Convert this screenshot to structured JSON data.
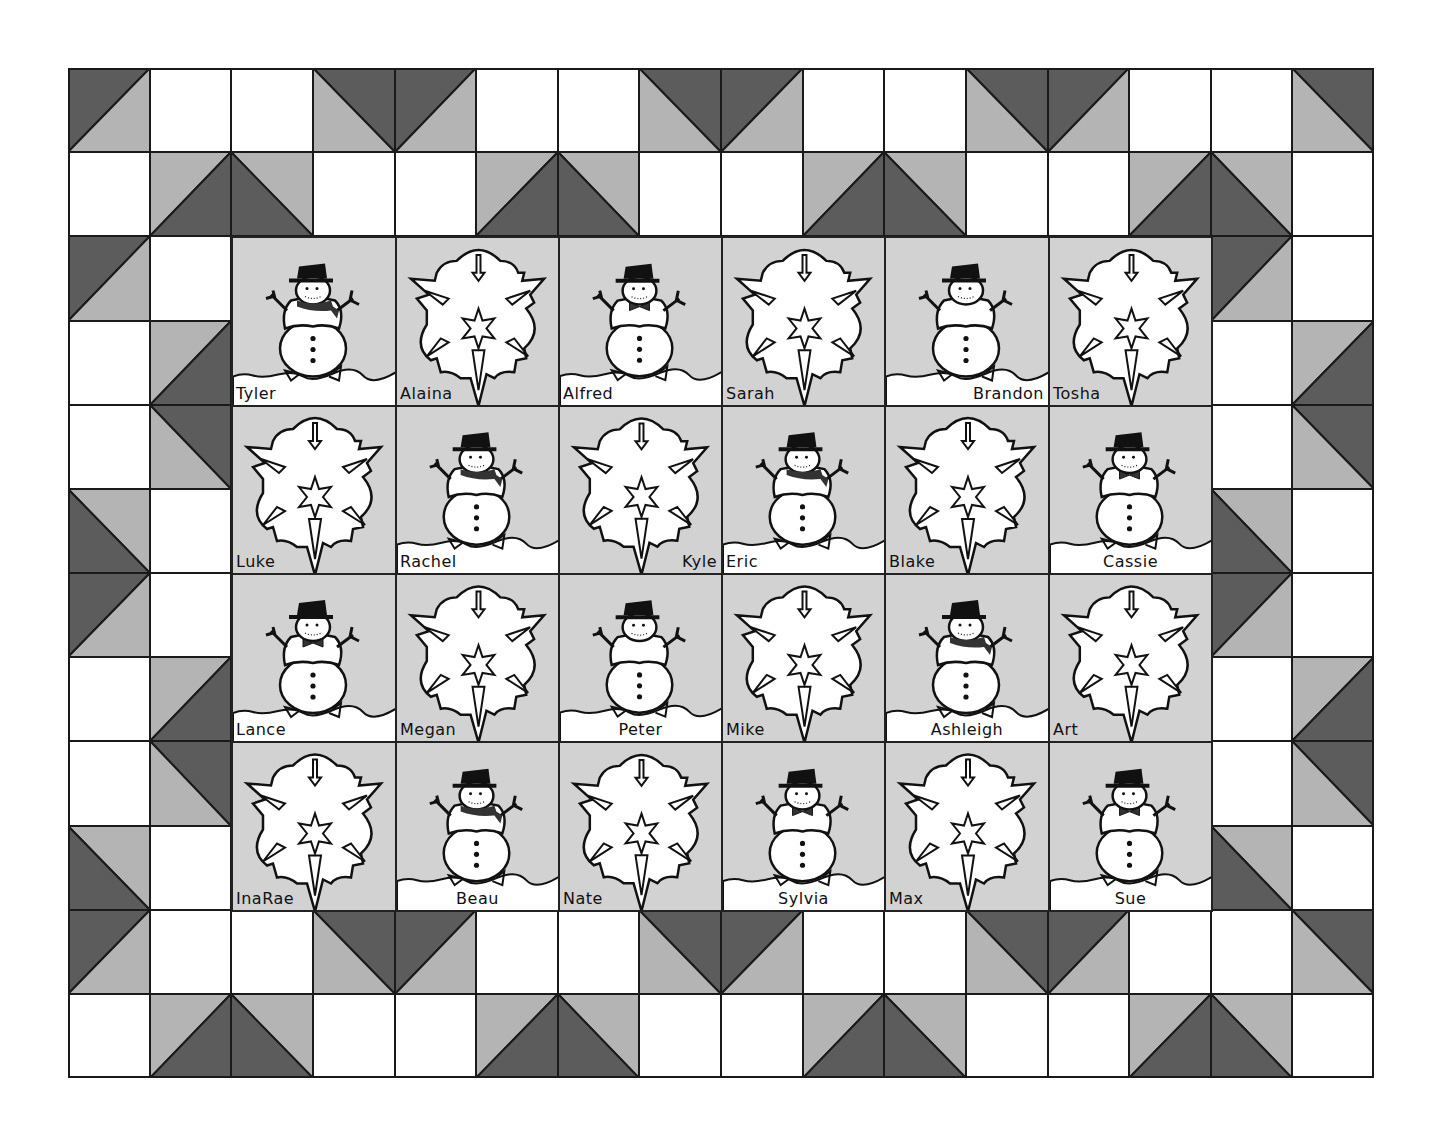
{
  "quilt": {
    "columns": 16,
    "rows": 12,
    "cell_w": 81.625,
    "cell_h": 84.17,
    "colors": {
      "dark": "#5c5c5c",
      "light": "#b4b4b4",
      "white": "#ffffff",
      "block_bg": "#d2d2d2",
      "snow": "#ffffff",
      "line": "#1a1a1a"
    },
    "border_rows": [
      [
        "A",
        "W",
        "W",
        "B",
        "A",
        "W",
        "W",
        "B",
        "A",
        "W",
        "W",
        "B",
        "A",
        "W",
        "W",
        "B"
      ],
      [
        "W",
        "C",
        "D",
        "W",
        "W",
        "C",
        "D",
        "W",
        "W",
        "C",
        "D",
        "W",
        "W",
        "C",
        "D",
        "W"
      ],
      [
        "A",
        "W",
        "",
        "",
        "",
        "",
        "",
        "",
        "",
        "",
        "",
        "",
        "",
        "",
        "A",
        "W"
      ],
      [
        "W",
        "C",
        "",
        "",
        "",
        "",
        "",
        "",
        "",
        "",
        "",
        "",
        "",
        "",
        "W",
        "C"
      ],
      [
        "W",
        "B",
        "",
        "",
        "",
        "",
        "",
        "",
        "",
        "",
        "",
        "",
        "",
        "",
        "W",
        "B"
      ],
      [
        "D",
        "W",
        "",
        "",
        "",
        "",
        "",
        "",
        "",
        "",
        "",
        "",
        "",
        "",
        "D",
        "W"
      ],
      [
        "A",
        "W",
        "",
        "",
        "",
        "",
        "",
        "",
        "",
        "",
        "",
        "",
        "",
        "",
        "A",
        "W"
      ],
      [
        "W",
        "C",
        "",
        "",
        "",
        "",
        "",
        "",
        "",
        "",
        "",
        "",
        "",
        "",
        "W",
        "C"
      ],
      [
        "W",
        "B",
        "",
        "",
        "",
        "",
        "",
        "",
        "",
        "",
        "",
        "",
        "",
        "",
        "W",
        "B"
      ],
      [
        "D",
        "W",
        "",
        "",
        "",
        "",
        "",
        "",
        "",
        "",
        "",
        "",
        "",
        "",
        "D",
        "W"
      ],
      [
        "A",
        "W",
        "W",
        "B",
        "A",
        "W",
        "W",
        "B",
        "A",
        "W",
        "W",
        "B",
        "A",
        "W",
        "W",
        "B"
      ],
      [
        "W",
        "C",
        "D",
        "W",
        "W",
        "C",
        "D",
        "W",
        "W",
        "C",
        "D",
        "W",
        "W",
        "C",
        "D",
        "W"
      ]
    ]
  },
  "blocks": [
    [
      {
        "type": "snowman",
        "name": "Tyler",
        "accessory": "scarf",
        "name_align": "left"
      },
      {
        "type": "snowflake",
        "name": "Alaina",
        "name_align": "left"
      },
      {
        "type": "snowman",
        "name": "Alfred",
        "accessory": "bowtie",
        "name_align": "left"
      },
      {
        "type": "snowflake",
        "name": "Sarah",
        "name_align": "left"
      },
      {
        "type": "snowman",
        "name": "Brandon",
        "accessory": "none",
        "name_align": "right"
      },
      {
        "type": "snowflake",
        "name": "Tosha",
        "name_align": "left"
      }
    ],
    [
      {
        "type": "snowflake",
        "name": "Luke",
        "name_align": "left"
      },
      {
        "type": "snowman",
        "name": "Rachel",
        "accessory": "scarf",
        "name_align": "left"
      },
      {
        "type": "snowflake",
        "name": "Kyle",
        "name_align": "right"
      },
      {
        "type": "snowman",
        "name": "Eric",
        "accessory": "scarf",
        "name_align": "left"
      },
      {
        "type": "snowflake",
        "name": "Blake",
        "name_align": "left"
      },
      {
        "type": "snowman",
        "name": "Cassie",
        "accessory": "bowtie",
        "name_align": "center"
      }
    ],
    [
      {
        "type": "snowman",
        "name": "Lance",
        "accessory": "bowtie",
        "name_align": "left"
      },
      {
        "type": "snowflake",
        "name": "Megan",
        "name_align": "left"
      },
      {
        "type": "snowman",
        "name": "Peter",
        "accessory": "none",
        "name_align": "center"
      },
      {
        "type": "snowflake",
        "name": "Mike",
        "name_align": "left"
      },
      {
        "type": "snowman",
        "name": "Ashleigh",
        "accessory": "scarf",
        "name_align": "center"
      },
      {
        "type": "snowflake",
        "name": "Art",
        "name_align": "left"
      }
    ],
    [
      {
        "type": "snowflake",
        "name": "InaRae",
        "name_align": "left"
      },
      {
        "type": "snowman",
        "name": "Beau",
        "accessory": "scarf",
        "name_align": "center"
      },
      {
        "type": "snowflake",
        "name": "Nate",
        "name_align": "left"
      },
      {
        "type": "snowman",
        "name": "Sylvia",
        "accessory": "bowtie",
        "name_align": "center"
      },
      {
        "type": "snowflake",
        "name": "Max",
        "name_align": "left"
      },
      {
        "type": "snowman",
        "name": "Sue",
        "accessory": "bowtie",
        "name_align": "center"
      }
    ]
  ],
  "icons": {
    "snowman": "snowman-icon",
    "snowflake": "snowflake-icon"
  }
}
